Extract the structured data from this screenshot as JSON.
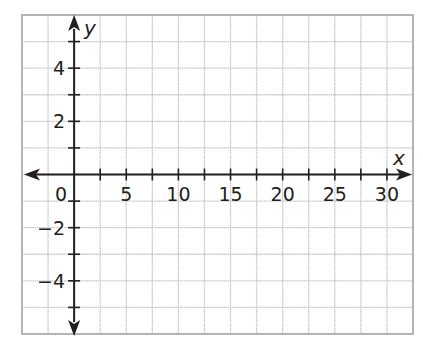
{
  "chart_data": {
    "type": "scatter",
    "title": "",
    "xlabel": "x",
    "ylabel": "y",
    "xlim": [
      -5,
      32.5
    ],
    "ylim": [
      -6,
      6
    ],
    "x_tick_step": 2.5,
    "y_tick_step": 1,
    "x_tick_labels": [
      {
        "value": 0,
        "text": "0"
      },
      {
        "value": 5,
        "text": "5"
      },
      {
        "value": 10,
        "text": "10"
      },
      {
        "value": 15,
        "text": "15"
      },
      {
        "value": 20,
        "text": "20"
      },
      {
        "value": 25,
        "text": "25"
      },
      {
        "value": 30,
        "text": "30"
      }
    ],
    "y_tick_labels": [
      {
        "value": 4,
        "text": "4"
      },
      {
        "value": 2,
        "text": "2"
      },
      {
        "value": -2,
        "text": "−2"
      },
      {
        "value": -4,
        "text": "−4"
      }
    ],
    "grid": true,
    "points": [],
    "series": []
  },
  "colors": {
    "axis": "#231f20",
    "grid": "#c8c8c8",
    "border": "#b4b4b4"
  }
}
